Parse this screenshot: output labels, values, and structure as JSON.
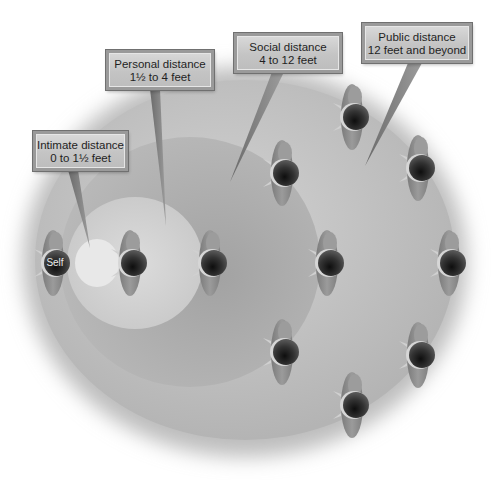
{
  "diagram": {
    "zones": [
      {
        "id": "intimate",
        "name": "Intimate distance",
        "range": "0 to 1½ feet"
      },
      {
        "id": "personal",
        "name": "Personal distance",
        "range": "1½ to 4 feet"
      },
      {
        "id": "social",
        "name": "Social distance",
        "range": "4 to 12 feet"
      },
      {
        "id": "public",
        "name": "Public distance",
        "range": "12 feet and beyond"
      }
    ],
    "self_label": "Self",
    "people_count": 11,
    "colors": {
      "label_bg": "#c8c8c8",
      "label_border": "#8c8c8c",
      "intimate_zone": "#e6e6e6",
      "personal_zone": "#d3d3d3",
      "social_zone": "#a9a9a9",
      "public_zone": "#bebebe",
      "head": "#2a2a2a",
      "body": "#8a8a8a"
    }
  }
}
